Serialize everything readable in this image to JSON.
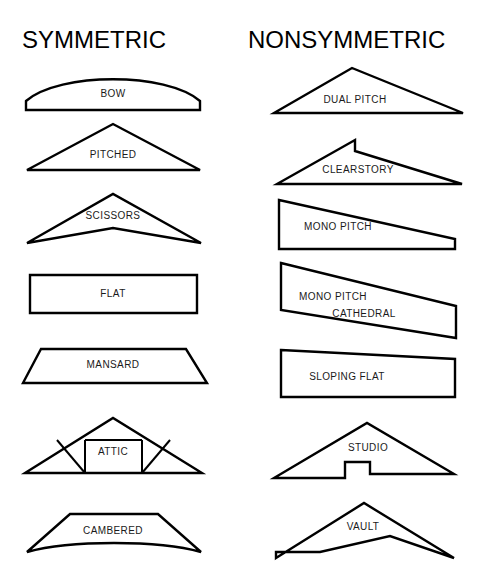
{
  "figure": {
    "background_color": "#ffffff",
    "line_color": "#000000",
    "label_color": "#1a1a1a",
    "width": 487,
    "height": 574
  },
  "columns": [
    {
      "id": "symmetric",
      "heading": "SYMMETRIC",
      "heading_x": 22,
      "heading_y": 48
    },
    {
      "id": "nonsymmetric",
      "heading": "NONSYMMETRIC",
      "heading_x": 248,
      "heading_y": 48
    }
  ],
  "chart_data": {
    "type": "diagram",
    "categories": [
      "SYMMETRIC",
      "NONSYMMETRIC"
    ],
    "count": 14
  },
  "trusses": [
    {
      "name": "BOW",
      "column": "symmetric",
      "label": "BOW",
      "label_x": 113,
      "label_y": 97,
      "path": "M 26 110 L 26 101 C 60 72 166 72 200 101 L 200 110 Z",
      "webs": []
    },
    {
      "name": "PITCHED",
      "column": "symmetric",
      "label": "PITCHED",
      "label_x": 113,
      "label_y": 158,
      "path": "M 27 170 L 113 124 L 200 170 Z",
      "webs": []
    },
    {
      "name": "SCISSORS",
      "column": "symmetric",
      "label": "SCISSORS",
      "label_x": 113,
      "label_y": 219,
      "path": "M 27 243 L 113 194 L 201 243 L 113 228 Z",
      "webs": []
    },
    {
      "name": "FLAT",
      "column": "symmetric",
      "label": "FLAT",
      "label_x": 113,
      "label_y": 297,
      "path": "M 30 275 L 197 275 L 197 313 L 30 313 Z",
      "webs": []
    },
    {
      "name": "MANSARD",
      "column": "symmetric",
      "label": "MANSARD",
      "label_x": 113,
      "label_y": 368,
      "path": "M 41 349 L 186 349 L 207 383 L 23 383 Z",
      "webs": []
    },
    {
      "name": "ATTIC",
      "column": "symmetric",
      "label": "ATTIC",
      "label_x": 113,
      "label_y": 455,
      "path": "M 25 473 L 113 418 L 202 473 Z",
      "webs": [
        "M 85 440 L 85 473",
        "M 142 440 L 142 473",
        "M 85 440 L 142 440",
        "M 85 473 L 57 440",
        "M 142 473 L 170 440"
      ]
    },
    {
      "name": "CAMBERED",
      "column": "symmetric",
      "label": "CAMBERED",
      "label_x": 113,
      "label_y": 534,
      "path": "M 27 552 L 70 514 L 158 514 L 201 552 C 158 540 70 540 27 552 Z",
      "webs": []
    },
    {
      "name": "DUAL PITCH",
      "column": "nonsymmetric",
      "label": "DUAL PITCH",
      "label_x": 355,
      "label_y": 103,
      "path": "M 274 113 L 352 68 L 463 113 Z",
      "webs": []
    },
    {
      "name": "CLEARSTORY",
      "column": "nonsymmetric",
      "label": "CLEARSTORY",
      "label_x": 358,
      "label_y": 173,
      "path": "M 277 184 L 355 140 L 355 151 L 462 184 Z",
      "webs": []
    },
    {
      "name": "MONO PITCH",
      "column": "nonsymmetric",
      "label": "MONO PITCH",
      "label_x": 338,
      "label_y": 230,
      "path": "M 279 200 L 455 239 L 455 249 L 279 249 Z",
      "webs": []
    },
    {
      "name": "MONO PITCH CATHEDRAL",
      "column": "nonsymmetric",
      "label": "MONO PITCH",
      "label2": "CATHEDRAL",
      "label_x": 333,
      "label_y": 300,
      "label2_x": 364,
      "label2_y": 317,
      "path": "M 281 263 L 456 306 L 456 338 L 281 310 Z",
      "webs": []
    },
    {
      "name": "SLOPING FLAT",
      "column": "nonsymmetric",
      "label": "SLOPING FLAT",
      "label_x": 347,
      "label_y": 380,
      "path": "M 281 350 L 455 359 L 455 397 L 281 397 Z",
      "webs": []
    },
    {
      "name": "STUDIO",
      "column": "nonsymmetric",
      "label": "STUDIO",
      "label_x": 368,
      "label_y": 451,
      "path": "M 274 478 L 367 423 L 454 474 L 370 474 L 370 462 L 345 462 L 345 478 Z",
      "webs": []
    },
    {
      "name": "VAULT",
      "column": "nonsymmetric",
      "label": "VAULT",
      "label_x": 363,
      "label_y": 530,
      "path": "M 276 558 L 364 503 L 454 558 L 390 536 L 320 552 L 276 552 Z",
      "webs": []
    }
  ]
}
